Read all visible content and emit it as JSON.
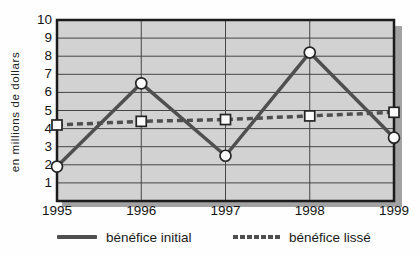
{
  "chart_data": {
    "type": "line",
    "title": "",
    "xlabel": "",
    "ylabel": "en millions de dollars",
    "categories": [
      "1995",
      "1996",
      "1997",
      "1998",
      "1999"
    ],
    "ylim": [
      0,
      10
    ],
    "yticks": [
      1,
      2,
      3,
      4,
      5,
      6,
      7,
      8,
      9,
      10
    ],
    "grid": true,
    "legend_position": "bottom",
    "series": [
      {
        "name": "bénéfice initial",
        "line_style": "solid",
        "marker": "circle",
        "values": [
          1.9,
          6.5,
          2.5,
          8.2,
          3.5
        ]
      },
      {
        "name": "bénéfice lissé",
        "line_style": "dashed",
        "marker": "square",
        "values": [
          4.2,
          4.4,
          4.5,
          4.7,
          4.9
        ]
      }
    ]
  },
  "colors": {
    "plot_background": "#d2d2d2",
    "gridline": "#454545",
    "plot_border": "#1b1b1b",
    "series_line": "#4f4f4f",
    "marker_fill": "#fcfcfc",
    "marker_stroke": "#242424",
    "shadow": "#a2a2a2",
    "text": "#1a1a1a"
  }
}
